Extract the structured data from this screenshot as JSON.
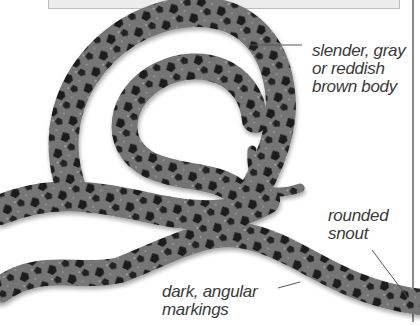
{
  "figure": {
    "colors": {
      "body": "#6e6e6e",
      "markings": "#1e1e1e",
      "label_text": "#3a3a3a",
      "top_box_fill": "#ececec",
      "rule": "#8c8c8c"
    }
  },
  "labels": {
    "body": [
      "slender, gray",
      "or reddish",
      "brown body"
    ],
    "snout": [
      "rounded",
      "snout"
    ],
    "markings": [
      "dark, angular",
      "markings"
    ]
  }
}
